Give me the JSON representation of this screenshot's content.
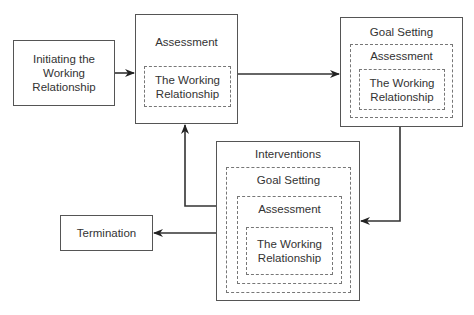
{
  "diagram": {
    "nodes": {
      "initiating": {
        "label": "Initiating the\nWorking\nRelationship"
      },
      "assessment": {
        "title": "Assessment",
        "inner": "The Working\nRelationship"
      },
      "goal_setting": {
        "title": "Goal Setting",
        "layer1": "Assessment",
        "inner": "The Working\nRelationship"
      },
      "interventions": {
        "title": "Interventions",
        "layer1": "Goal Setting",
        "layer2": "Assessment",
        "inner": "The Working\nRelationship"
      },
      "termination": {
        "label": "Termination"
      }
    },
    "edges": [
      {
        "from": "Initiating the Working Relationship",
        "to": "Assessment"
      },
      {
        "from": "Assessment",
        "to": "Goal Setting"
      },
      {
        "from": "Goal Setting",
        "to": "Interventions"
      },
      {
        "from": "Interventions",
        "to": "Assessment"
      },
      {
        "from": "Interventions",
        "to": "Termination"
      }
    ],
    "colors": {
      "line": "#333333",
      "box_border": "#555555",
      "dash_border": "#777777",
      "text": "#333333"
    }
  }
}
